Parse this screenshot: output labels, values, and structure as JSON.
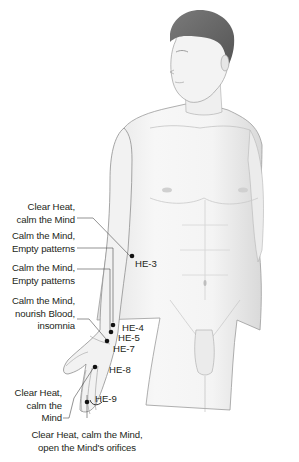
{
  "figure": {
    "colors": {
      "background": "#ffffff",
      "skin_fill": "#f2f2f2",
      "skin_outline": "#8a8a8a",
      "hair": "#6b6b6b",
      "leader_line": "#4a4a4a",
      "point": "#111111",
      "text": "#231f20"
    }
  },
  "annotations": [
    {
      "id": "he3",
      "label_lines": [
        "Clear Heat,",
        "calm the Mind"
      ],
      "point": "HE-3"
    },
    {
      "id": "he4",
      "label_lines": [
        "Calm the Mind,",
        "Empty patterns"
      ],
      "point": "HE-4"
    },
    {
      "id": "he5",
      "label_lines": [
        "Calm the Mind,",
        "Empty patterns"
      ],
      "point": "HE-5"
    },
    {
      "id": "he7",
      "label_lines": [
        "Calm the Mind,",
        "nourish Blood,",
        "insomnia"
      ],
      "point": "HE-7"
    },
    {
      "id": "he8",
      "label_lines": [
        "Clear Heat,",
        "calm the",
        "Mind"
      ],
      "point": "HE-8"
    },
    {
      "id": "he9",
      "label_lines": [
        "Clear Heat, calm the Mind,",
        "open the Mind's orifices"
      ],
      "point": "HE-9"
    }
  ],
  "points": [
    "HE-3",
    "HE-4",
    "HE-5",
    "HE-7",
    "HE-8",
    "HE-9"
  ]
}
